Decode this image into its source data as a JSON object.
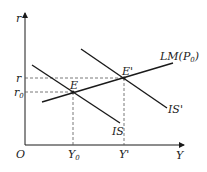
{
  "diagram": {
    "type": "IS-LM shift diagram",
    "axes": {
      "y_label": "r",
      "x_label": "Y",
      "origin_label": "O"
    },
    "curves": {
      "lm": {
        "label": "LM",
        "param": "P",
        "param_sub": "0"
      },
      "is": {
        "label": "IS"
      },
      "is_prime": {
        "label": "IS'"
      }
    },
    "points": {
      "e": {
        "label": "E"
      },
      "e_prime": {
        "label": "E'"
      }
    },
    "y_ticks": {
      "r": {
        "label": "r"
      },
      "r0": {
        "label": "r",
        "sub": "0"
      }
    },
    "x_ticks": {
      "y0": {
        "label": "Y",
        "sub": "0"
      },
      "y_prime": {
        "label": "Y'"
      }
    },
    "colors": {
      "line": "#1a1a1a",
      "dashed": "#555555"
    }
  }
}
